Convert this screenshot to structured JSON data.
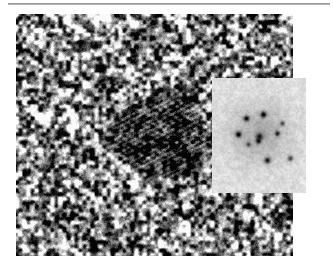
{
  "figure": {
    "kind": "hrtem-micrograph",
    "canvas_width": 333,
    "canvas_height": 270,
    "background_color": "#ffffff",
    "caption": "",
    "top_rule": {
      "name": "horizontal-rule",
      "x": 8,
      "y": 3,
      "width": 322,
      "height": 2,
      "color": "#9a9a9a"
    }
  },
  "micrograph": {
    "label": "",
    "x": 16,
    "y": 14,
    "width": 277,
    "height": 242,
    "mean_gray": "#8a8a8a",
    "background_texture": {
      "type": "amorphous-speckle",
      "grain_px": 4,
      "contrast": 0.95,
      "min_gray": "#0d0d0d",
      "max_gray": "#f2f2f2"
    },
    "nanoparticle": {
      "name": "crystalline-nanoparticle",
      "center_x": 157,
      "center_y": 133,
      "radius_x": 60,
      "radius_y": 50,
      "darkening": 0.42,
      "lattice": {
        "visible": true,
        "fringe_angle_deg": 62,
        "fringe_spacing_px": 4.6,
        "second_fringe_angle_deg": 118,
        "second_fringe_spacing_px": 5.4,
        "amplitude": 0.55
      }
    }
  },
  "fft_inset": {
    "label": "",
    "x": 212,
    "y": 78,
    "width": 94,
    "height": 115,
    "background_gray": "#dedede",
    "halo": {
      "center_x": 47,
      "center_y": 55,
      "radius": 30,
      "darkening": 0.22
    },
    "noise_amplitude": 0.09,
    "spots": [
      {
        "name": "spot-center",
        "x": 47,
        "y": 58,
        "r": 3.2,
        "intensity": 0.6
      },
      {
        "name": "spot-upper-left",
        "x": 34,
        "y": 40,
        "r": 2.6,
        "intensity": 0.78
      },
      {
        "name": "spot-upper-mid",
        "x": 51,
        "y": 36,
        "r": 2.8,
        "intensity": 0.8
      },
      {
        "name": "spot-upper-right",
        "x": 70,
        "y": 45,
        "r": 2.2,
        "intensity": 0.55
      },
      {
        "name": "spot-left",
        "x": 26,
        "y": 56,
        "r": 2.8,
        "intensity": 0.8
      },
      {
        "name": "spot-right",
        "x": 65,
        "y": 55,
        "r": 2.4,
        "intensity": 0.62
      },
      {
        "name": "spot-lower-mid",
        "x": 46,
        "y": 63,
        "r": 2.4,
        "intensity": 0.58
      },
      {
        "name": "spot-lower-left",
        "x": 36,
        "y": 66,
        "r": 2.2,
        "intensity": 0.52
      },
      {
        "name": "spot-lower",
        "x": 55,
        "y": 82,
        "r": 2.8,
        "intensity": 0.72
      },
      {
        "name": "spot-lower-right",
        "x": 78,
        "y": 80,
        "r": 2.6,
        "intensity": 0.62
      }
    ]
  }
}
